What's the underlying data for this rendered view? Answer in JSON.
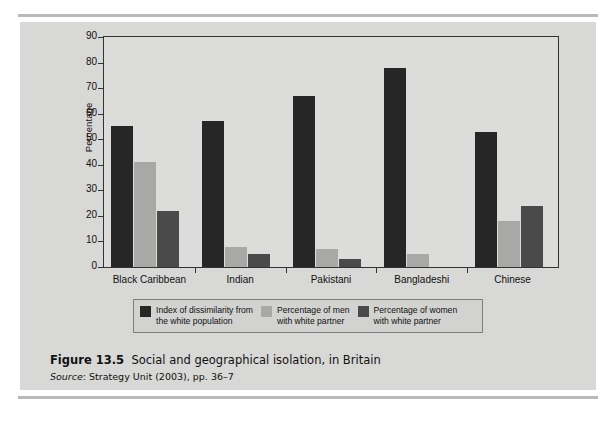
{
  "figure": {
    "number": "Figure 13.5",
    "title": "Social and geographical isolation, in Britain",
    "source_label": "Source",
    "source_text": ": Strategy Unit (2003), pp. 36–7"
  },
  "axis": {
    "y_title": "Percentage",
    "y_ticks": [
      "90",
      "80",
      "70",
      "60",
      "50",
      "40",
      "30",
      "20",
      "10",
      "0"
    ]
  },
  "legend": {
    "items": [
      {
        "label": "Index of dissimilarity from\nthe white population",
        "color": "#262626",
        "swatch_name": "legend-swatch-index-of-dissimilarity"
      },
      {
        "label": "Percentage of men\nwith white partner",
        "color": "#a8a8a6",
        "swatch_name": "legend-swatch-men-white-partner"
      },
      {
        "label": "Percentage of women\nwith white partner",
        "color": "#4a4a4a",
        "swatch_name": "legend-swatch-women-white-partner"
      }
    ]
  },
  "chart_data": {
    "type": "bar",
    "title": "Social and geographical isolation, in Britain",
    "xlabel": "",
    "ylabel": "Percentage",
    "ylim": [
      0,
      90
    ],
    "ytick_step": 10,
    "grid": false,
    "legend_position": "below-plot",
    "categories": [
      "Black Caribbean",
      "Indian",
      "Pakistani",
      "Bangladeshi",
      "Chinese"
    ],
    "series": [
      {
        "name": "Index of dissimilarity from the white population",
        "color": "#262626",
        "values": [
          55,
          57,
          67,
          78,
          53
        ]
      },
      {
        "name": "Percentage of men with white partner",
        "color": "#a8a8a6",
        "values": [
          41,
          8,
          7,
          5,
          18
        ]
      },
      {
        "name": "Percentage of women with white partner",
        "color": "#4a4a4a",
        "values": [
          22,
          5,
          3,
          0,
          24
        ]
      }
    ]
  }
}
